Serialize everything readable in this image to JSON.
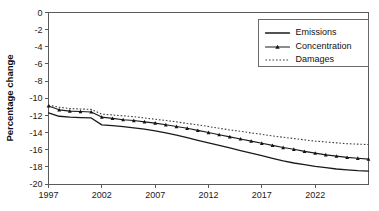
{
  "chart_data": {
    "type": "line",
    "title": "",
    "xlabel": "",
    "ylabel": "Percentage change",
    "xlim": [
      1997,
      2027
    ],
    "ylim": [
      -20,
      0
    ],
    "grid": false,
    "legend_position": "top-right",
    "x_tick_labels": [
      "1997",
      "2002",
      "2007",
      "2012",
      "2017",
      "2022"
    ],
    "x_tick_values": [
      1997,
      2002,
      2007,
      2012,
      2017,
      2022
    ],
    "y_tick_labels": [
      "0",
      "-2",
      "-4",
      "-6",
      "-8",
      "-10",
      "-12",
      "-14",
      "-16",
      "-18",
      "-20"
    ],
    "y_tick_values": [
      0,
      -2,
      -4,
      -6,
      -8,
      -10,
      -12,
      -14,
      -16,
      -18,
      -20
    ],
    "x": [
      1997,
      1998,
      1999,
      2000,
      2001,
      2002,
      2003,
      2004,
      2005,
      2006,
      2007,
      2008,
      2009,
      2010,
      2011,
      2012,
      2013,
      2014,
      2015,
      2016,
      2017,
      2018,
      2019,
      2020,
      2021,
      2022,
      2023,
      2024,
      2025,
      2026,
      2027
    ],
    "series": [
      {
        "name": "Emissions",
        "style": "solid",
        "marker": "none",
        "color": "#1a1a1a",
        "values": [
          -11.7,
          -12.1,
          -12.2,
          -12.25,
          -12.3,
          -13.1,
          -13.2,
          -13.3,
          -13.45,
          -13.6,
          -13.8,
          -14.05,
          -14.3,
          -14.6,
          -14.9,
          -15.2,
          -15.5,
          -15.8,
          -16.1,
          -16.4,
          -16.7,
          -17.0,
          -17.3,
          -17.55,
          -17.75,
          -17.95,
          -18.1,
          -18.25,
          -18.35,
          -18.45,
          -18.5
        ]
      },
      {
        "name": "Concentration",
        "style": "solid",
        "marker": "triangle",
        "color": "#1a1a1a",
        "values": [
          -10.9,
          -11.35,
          -11.5,
          -11.55,
          -11.6,
          -12.2,
          -12.35,
          -12.5,
          -12.6,
          -12.75,
          -12.9,
          -13.1,
          -13.3,
          -13.5,
          -13.75,
          -14.0,
          -14.25,
          -14.5,
          -14.75,
          -15.0,
          -15.25,
          -15.5,
          -15.75,
          -15.95,
          -16.2,
          -16.4,
          -16.6,
          -16.75,
          -16.9,
          -17.0,
          -17.1
        ]
      },
      {
        "name": "Damages",
        "style": "dotted",
        "marker": "none",
        "color": "#3d3d3d",
        "values": [
          -10.8,
          -11.05,
          -11.2,
          -11.25,
          -11.3,
          -11.85,
          -11.95,
          -12.05,
          -12.15,
          -12.3,
          -12.45,
          -12.6,
          -12.75,
          -12.95,
          -13.1,
          -13.3,
          -13.5,
          -13.7,
          -13.85,
          -14.05,
          -14.2,
          -14.4,
          -14.55,
          -14.7,
          -14.85,
          -15.0,
          -15.1,
          -15.2,
          -15.3,
          -15.35,
          -15.4
        ]
      }
    ]
  },
  "legend": {
    "entries": [
      {
        "label": "Emissions"
      },
      {
        "label": "Concentration"
      },
      {
        "label": "Damages"
      }
    ]
  }
}
